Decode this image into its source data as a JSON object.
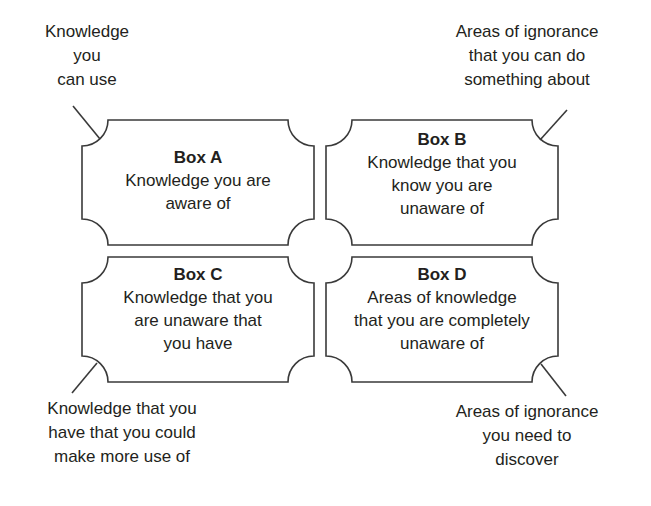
{
  "diagram": {
    "type": "four-quadrant knowledge/awareness diagram",
    "colors": {
      "stroke": "#3a3a3a",
      "text": "#231f20",
      "background": "#ffffff"
    },
    "boxes": [
      {
        "id": "A",
        "title": "Box A",
        "lines": [
          "Knowledge you are",
          "aware of"
        ]
      },
      {
        "id": "B",
        "title": "Box B",
        "lines": [
          "Knowledge that you",
          "know you are",
          "unaware of"
        ]
      },
      {
        "id": "C",
        "title": "Box C",
        "lines": [
          "Knowledge that you",
          "are unaware that",
          "you have"
        ]
      },
      {
        "id": "D",
        "title": "Box D",
        "lines": [
          "Areas of knowledge",
          "that you are completely",
          "unaware of"
        ]
      }
    ],
    "callouts": {
      "top_left": {
        "points_to": "Box A",
        "lines": [
          "Knowledge",
          "you",
          "can use"
        ]
      },
      "top_right": {
        "points_to": "Box B",
        "lines": [
          "Areas of ignorance",
          "that you can do",
          "something about"
        ]
      },
      "bottom_left": {
        "points_to": "Box C",
        "lines": [
          "Knowledge that you",
          "have that you could",
          "make more use of"
        ]
      },
      "bottom_right": {
        "points_to": "Box D",
        "lines": [
          "Areas of ignorance",
          "you need to",
          "discover"
        ]
      }
    }
  }
}
